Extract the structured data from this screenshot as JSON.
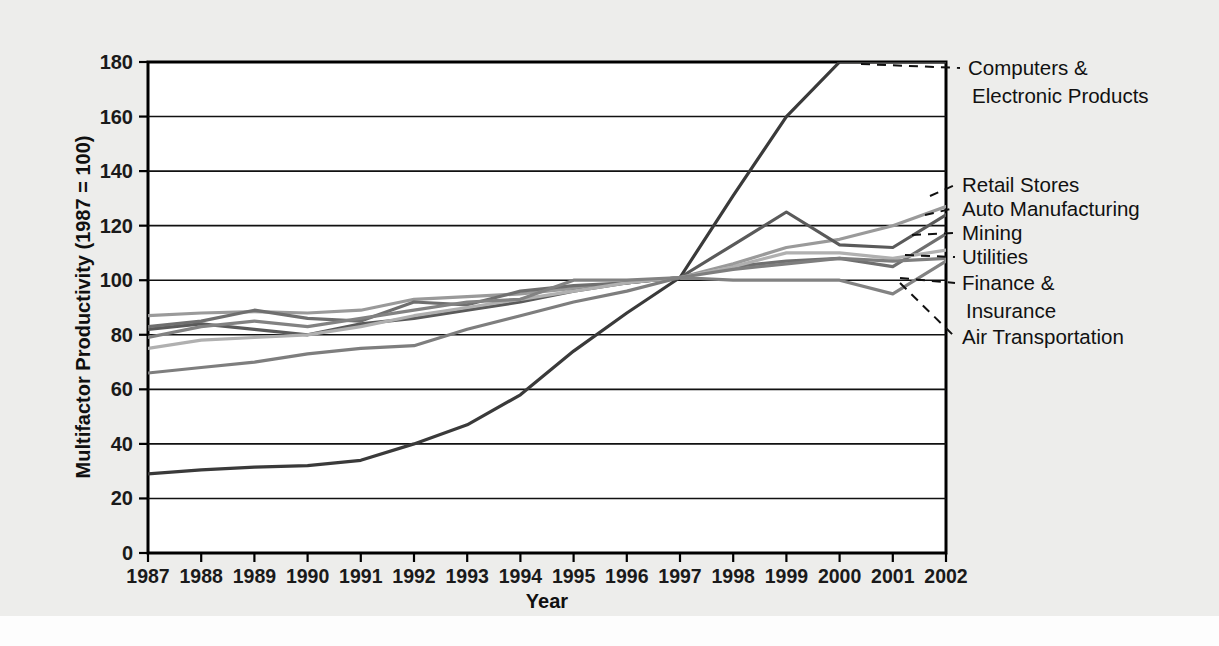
{
  "figure": {
    "background_color": "#ededeb",
    "plot_background_color": "#ffffff"
  },
  "chart_data": {
    "type": "line",
    "title": "",
    "xlabel": "Year",
    "ylabel": "Multifactor Productivity (1987 = 100)",
    "xlim": [
      1987,
      2002
    ],
    "ylim": [
      0,
      180
    ],
    "yticks": [
      0,
      20,
      40,
      60,
      80,
      100,
      120,
      140,
      160,
      180
    ],
    "grid": true,
    "legend_position": "right-annotations",
    "categories": [
      1987,
      1988,
      1989,
      1990,
      1991,
      1992,
      1993,
      1994,
      1995,
      1996,
      1997,
      1998,
      1999,
      2000,
      2001,
      2002
    ],
    "series": [
      {
        "name": "Computers & Electronic Products",
        "color": "#3a3a3a",
        "width": 3.2,
        "values": [
          29,
          30.5,
          31.5,
          32,
          34,
          40,
          47,
          58,
          74,
          88,
          101,
          131,
          160,
          180,
          180,
          180
        ]
      },
      {
        "name": "Retail Stores",
        "color": "#9a9a9a",
        "width": 3.2,
        "values": [
          87,
          88,
          88.5,
          88,
          89,
          93,
          94,
          95,
          97,
          99,
          101,
          106,
          112,
          115,
          120,
          127
        ]
      },
      {
        "name": "Auto Manufacturing",
        "color": "#5a5a5a",
        "width": 3.2,
        "values": [
          82,
          84,
          82,
          80,
          84,
          86,
          89,
          92,
          96,
          99,
          101,
          113,
          125,
          113,
          112,
          124
        ]
      },
      {
        "name": "Mining",
        "color": "#6f6f6f",
        "width": 3.2,
        "values": [
          83,
          85,
          89,
          86,
          85,
          92,
          91,
          96,
          98,
          99,
          101,
          105,
          107,
          108,
          105,
          117
        ]
      },
      {
        "name": "Utilities",
        "color": "#b0b0b0",
        "width": 3.2,
        "values": [
          75,
          78,
          79,
          80,
          83,
          87,
          90,
          93,
          96,
          99,
          101,
          105,
          110,
          110,
          108,
          111
        ]
      },
      {
        "name": "Finance & Insurance",
        "color": "#7e7e7e",
        "width": 3.2,
        "values": [
          66,
          68,
          70,
          73,
          75,
          76,
          82,
          87,
          92,
          96,
          101,
          104,
          106,
          108,
          107,
          108
        ]
      },
      {
        "name": "Air Transportation",
        "color": "#828282",
        "width": 3.2,
        "values": [
          79,
          83,
          85,
          83,
          86,
          89,
          92,
          93,
          100,
          100,
          101,
          100,
          100,
          100,
          95,
          107
        ]
      }
    ]
  },
  "annotations": [
    {
      "id": "computers",
      "label_line_1": "Computers &",
      "label_line_2": "Electronic Products"
    },
    {
      "id": "retail",
      "label_line_1": "Retail Stores",
      "label_line_2": ""
    },
    {
      "id": "auto",
      "label_line_1": "Auto Manufacturing",
      "label_line_2": ""
    },
    {
      "id": "mining",
      "label_line_1": "Mining",
      "label_line_2": ""
    },
    {
      "id": "utilities",
      "label_line_1": "Utilities",
      "label_line_2": ""
    },
    {
      "id": "finance",
      "label_line_1": "Finance &",
      "label_line_2": "Insurance"
    },
    {
      "id": "air",
      "label_line_1": "Air Transportation",
      "label_line_2": ""
    }
  ],
  "axes": {
    "y_tick_labels": [
      "180",
      "160",
      "140",
      "120",
      "100",
      "80",
      "60",
      "40",
      "20",
      "0"
    ],
    "x_tick_labels": [
      "1987",
      "1988",
      "1989",
      "1990",
      "1991",
      "1992",
      "1993",
      "1994",
      "1995",
      "1996",
      "1997",
      "1998",
      "1999",
      "2000",
      "2001",
      "2002"
    ],
    "y_axis_title": "Multifactor Productivity (1987 = 100)",
    "x_axis_title": "Year"
  }
}
